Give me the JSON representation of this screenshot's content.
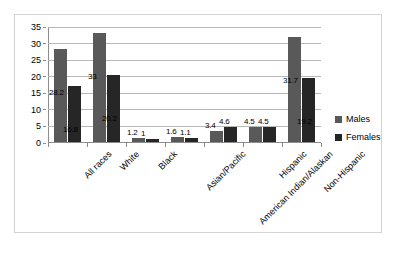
{
  "chart_data": {
    "type": "bar",
    "title": "",
    "subtitle": "",
    "xlabel": "",
    "ylabel": "",
    "ylim": [
      0,
      35
    ],
    "grid": true,
    "legend_position": "right",
    "categories": [
      "All races",
      "White",
      "Black",
      "Asian/Pacific",
      "American Indian/Alaskan",
      "Hispanic",
      "Non-Hispanic"
    ],
    "y_ticks": [
      "0",
      "5",
      "10",
      "15",
      "20",
      "25",
      "30",
      "35"
    ],
    "series": [
      {
        "name": "Males",
        "color": "#595959",
        "values": [
          28.2,
          33,
          1.2,
          1.6,
          3.4,
          4.5,
          31.7
        ],
        "labels": [
          "28.2",
          "33",
          "1.2",
          "1.6",
          "3.4",
          "4.5",
          "31.7"
        ]
      },
      {
        "name": "Females",
        "color": "#262626",
        "values": [
          16.8,
          20.2,
          1,
          1.1,
          4.6,
          4.5,
          19.2
        ],
        "labels": [
          "16.8",
          "20.2",
          "1",
          "1.1",
          "4.6",
          "4.5",
          "19.2"
        ]
      }
    ]
  },
  "legend": {
    "items": [
      {
        "label": "Males",
        "color": "#595959"
      },
      {
        "label": "Females",
        "color": "#262626"
      }
    ]
  }
}
